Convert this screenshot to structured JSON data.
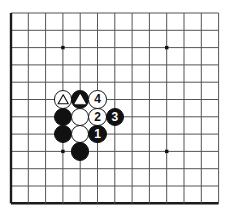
{
  "figure": {
    "kind": "go-board-diagram",
    "board_size_visible": {
      "columns": 13,
      "rows": 12
    },
    "colors": {
      "background": "#ffffff",
      "grid_line": "#555555",
      "border_line": "#1a1a1a",
      "black_stone": "#111111",
      "white_stone": "#ffffff",
      "stone_outline": "#1a1a1a",
      "star_point": "#111111"
    },
    "geometry": {
      "origin_x": 11,
      "origin_y": 13,
      "spacing": 17.3,
      "stone_radius": 9.2,
      "border_thickness": 2.4,
      "grid_thickness": 1
    },
    "star_points": [
      {
        "col": 3,
        "row": 2
      },
      {
        "col": 9,
        "row": 2
      },
      {
        "col": 3,
        "row": 8
      },
      {
        "col": 9,
        "row": 8
      }
    ],
    "stones": [
      {
        "id": "w-triangle",
        "col": 3,
        "row": 5,
        "color": "white",
        "marker": "triangle",
        "label": ""
      },
      {
        "id": "b-triangle",
        "col": 4,
        "row": 5,
        "color": "black",
        "marker": "triangle",
        "label": ""
      },
      {
        "id": "move-4",
        "col": 5,
        "row": 5,
        "color": "white",
        "marker": "number",
        "label": "4"
      },
      {
        "id": "b-plain-a",
        "col": 3,
        "row": 6,
        "color": "black",
        "marker": "none",
        "label": ""
      },
      {
        "id": "w-plain-a",
        "col": 4,
        "row": 6,
        "color": "white",
        "marker": "none",
        "label": ""
      },
      {
        "id": "move-2",
        "col": 5,
        "row": 6,
        "color": "white",
        "marker": "number",
        "label": "2"
      },
      {
        "id": "move-3",
        "col": 6,
        "row": 6,
        "color": "black",
        "marker": "number",
        "label": "3"
      },
      {
        "id": "b-plain-b",
        "col": 3,
        "row": 7,
        "color": "black",
        "marker": "none",
        "label": ""
      },
      {
        "id": "w-plain-b",
        "col": 4,
        "row": 7,
        "color": "white",
        "marker": "none",
        "label": ""
      },
      {
        "id": "move-1",
        "col": 5,
        "row": 7,
        "color": "black",
        "marker": "number",
        "label": "1"
      },
      {
        "id": "b-plain-c",
        "col": 4,
        "row": 8,
        "color": "black",
        "marker": "none",
        "label": ""
      }
    ]
  }
}
